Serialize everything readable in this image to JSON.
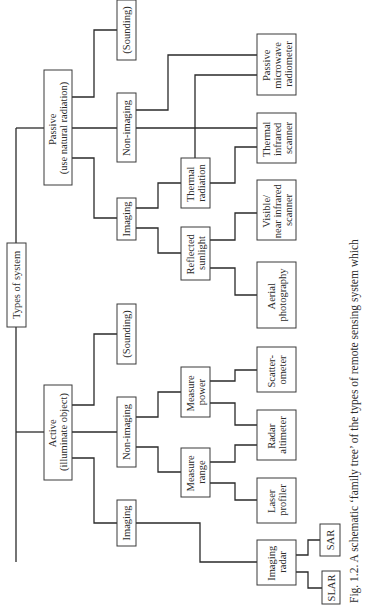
{
  "figure": {
    "orientation": "rotated-90-ccw",
    "caption": "Fig. 1.2. A schematic ‘family tree’ of the types of remote sensing system which"
  },
  "nodes": {
    "root": {
      "lines": [
        "Types of system"
      ]
    },
    "passive": {
      "lines": [
        "Passive",
        "(use natural radiation)"
      ]
    },
    "active": {
      "lines": [
        "Active",
        "(illuminate object)"
      ]
    },
    "passive_sounding": {
      "lines": [
        "(Sounding)"
      ]
    },
    "passive_nonimaging": {
      "lines": [
        "Non-imaging"
      ]
    },
    "passive_imaging": {
      "lines": [
        "Imaging"
      ]
    },
    "thermal_radiation": {
      "lines": [
        "Thermal",
        "radiation"
      ]
    },
    "reflected_sunlight": {
      "lines": [
        "Reflected",
        "sunlight"
      ]
    },
    "passive_microwave": {
      "lines": [
        "Passive",
        "microwave",
        "radiometer"
      ]
    },
    "thermal_ir_scanner": {
      "lines": [
        "Thermal",
        "infrared",
        "scanner"
      ]
    },
    "visible_nir_scanner": {
      "lines": [
        "Visible/",
        "near infrared",
        "scanner"
      ]
    },
    "aerial_photography": {
      "lines": [
        "Aerial",
        "photography"
      ]
    },
    "active_sounding": {
      "lines": [
        "(Sounding)"
      ]
    },
    "active_nonimaging": {
      "lines": [
        "Non-imaging"
      ]
    },
    "active_imaging": {
      "lines": [
        "Imaging"
      ]
    },
    "measure_power": {
      "lines": [
        "Measure",
        "power"
      ]
    },
    "measure_range": {
      "lines": [
        "Measure",
        "range"
      ]
    },
    "scatterometer": {
      "lines": [
        "Scatter-",
        "ometer"
      ]
    },
    "radar_altimeter": {
      "lines": [
        "Radar",
        "altimeter"
      ]
    },
    "laser_profiler": {
      "lines": [
        "Laser",
        "profiler"
      ]
    },
    "imaging_radar": {
      "lines": [
        "Imaging",
        "radar"
      ]
    },
    "sar": {
      "lines": [
        "SAR"
      ]
    },
    "slar": {
      "lines": [
        "SLAR"
      ]
    }
  },
  "tree": {
    "label": "Types of system",
    "children": [
      {
        "label": "Passive (use natural radiation)",
        "children": [
          {
            "label": "Imaging",
            "children": [
              {
                "label": "Reflected sunlight",
                "children": [
                  {
                    "label": "Aerial photography"
                  },
                  {
                    "label": "Visible/near infrared scanner"
                  }
                ]
              },
              {
                "label": "Thermal radiation",
                "children": [
                  {
                    "label": "Thermal infrared scanner"
                  },
                  {
                    "label": "Passive microwave radiometer"
                  }
                ]
              }
            ]
          },
          {
            "label": "Non-imaging",
            "children": [
              {
                "label": "Thermal infrared scanner"
              },
              {
                "label": "Passive microwave radiometer"
              }
            ]
          },
          {
            "label": "(Sounding)"
          }
        ]
      },
      {
        "label": "Active (illuminate object)",
        "children": [
          {
            "label": "Imaging",
            "children": [
              {
                "label": "Imaging radar",
                "children": [
                  {
                    "label": "SLAR"
                  },
                  {
                    "label": "SAR"
                  }
                ]
              }
            ]
          },
          {
            "label": "Non-imaging",
            "children": [
              {
                "label": "Measure range",
                "children": [
                  {
                    "label": "Laser profiler"
                  },
                  {
                    "label": "Radar altimeter"
                  }
                ]
              },
              {
                "label": "Measure power",
                "children": [
                  {
                    "label": "Radar altimeter"
                  },
                  {
                    "label": "Scatterometer"
                  }
                ]
              }
            ]
          },
          {
            "label": "(Sounding)"
          }
        ]
      }
    ]
  }
}
